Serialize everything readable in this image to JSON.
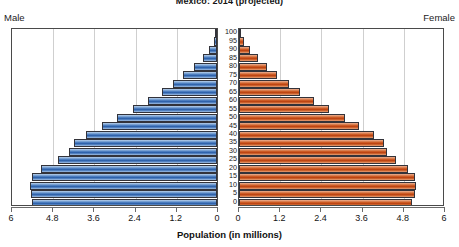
{
  "chart": {
    "title": "Mexico: 2014 (projected)",
    "male_label": "Male",
    "female_label": "Female",
    "xlabel": "Population (in millions)"
  },
  "chart_data": {
    "type": "bar",
    "subtype": "population-pyramid",
    "title": "Mexico: 2014 (projected)",
    "xlabel": "Population (in millions)",
    "ylabel": "Age",
    "grid": true,
    "legend": [
      "Male",
      "Female"
    ],
    "legend_position": "top-left-and-top-right",
    "xlim": [
      0,
      6
    ],
    "x_ticks_male": [
      "6",
      "4.8",
      "3.6",
      "2.4",
      "1.2",
      "0"
    ],
    "x_ticks_female": [
      "0",
      "1.2",
      "2.4",
      "3.6",
      "4.8",
      "6"
    ],
    "x_tick_values": [
      0,
      1.2,
      2.4,
      3.6,
      4.8,
      6
    ],
    "categories": [
      "0",
      "5",
      "10",
      "15",
      "20",
      "25",
      "30",
      "35",
      "40",
      "45",
      "50",
      "55",
      "60",
      "65",
      "70",
      "75",
      "80",
      "85",
      "90",
      "95",
      "100"
    ],
    "age_labels": [
      "100",
      "95",
      "90",
      "85",
      "80",
      "75",
      "70",
      "65",
      "60",
      "55",
      "50",
      "45",
      "40",
      "35",
      "30",
      "25",
      "20",
      "15",
      "10",
      "5",
      "0"
    ],
    "series": [
      {
        "name": "Male",
        "color": "#2f62aa",
        "direction": "left",
        "values": [
          5.38,
          5.42,
          5.45,
          5.38,
          5.12,
          4.62,
          4.32,
          4.18,
          3.82,
          3.35,
          2.92,
          2.45,
          2.02,
          1.6,
          1.28,
          0.98,
          0.68,
          0.42,
          0.22,
          0.09,
          0.03
        ]
      },
      {
        "name": "Female",
        "color": "#cc5a23",
        "direction": "right",
        "values": [
          5.05,
          5.12,
          5.15,
          5.12,
          4.92,
          4.58,
          4.32,
          4.22,
          3.92,
          3.5,
          3.08,
          2.62,
          2.18,
          1.78,
          1.45,
          1.12,
          0.82,
          0.54,
          0.31,
          0.14,
          0.05
        ]
      }
    ]
  }
}
